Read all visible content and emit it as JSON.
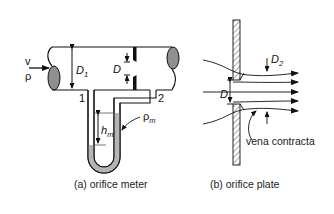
{
  "diagram": {
    "panel_a": {
      "caption": "(a) orifice meter",
      "labels": {
        "velocity": "v",
        "density": "ρ",
        "pipe_diameter_main": "D",
        "pipe_diameter_sub": "1",
        "orifice_diameter": "D",
        "tap_1": "1",
        "tap_2": "2",
        "head_main": "h",
        "head_sub": "m",
        "manometer_fluid_main": "ρ",
        "manometer_fluid_sub": "m"
      }
    },
    "panel_b": {
      "caption": "(b) orifice plate",
      "labels": {
        "orifice_diameter": "D",
        "contracta_diameter_main": "D",
        "contracta_diameter_sub": "2",
        "vena_contracta": "vena contracta"
      }
    },
    "colors": {
      "line": "#111111",
      "fill_gray": "#9a9a9a",
      "manometer_fluid": "#b5b5b5",
      "background": "#ffffff"
    }
  }
}
